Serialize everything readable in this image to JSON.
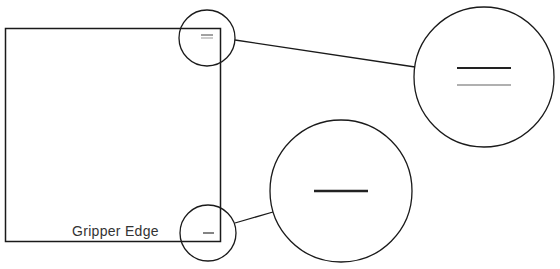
{
  "diagram": {
    "sheet": {
      "label": "Gripper Edge",
      "stroke": "#1a1a1a"
    },
    "callouts": [
      {
        "name": "top-right-corner-mark",
        "marks": [
          {
            "color": "#1a1a1a"
          },
          {
            "color": "#b0b0b0"
          }
        ]
      },
      {
        "name": "bottom-right-corner-mark",
        "marks": [
          {
            "color": "#1a1a1a"
          }
        ]
      }
    ]
  }
}
